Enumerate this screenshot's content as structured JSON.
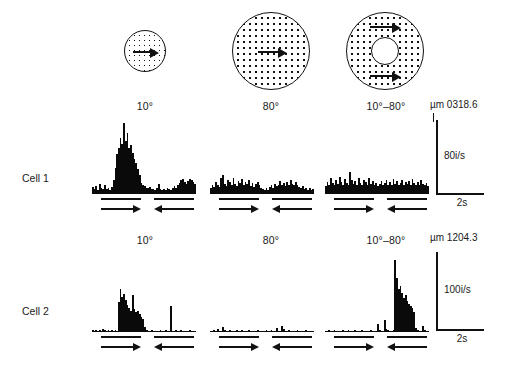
{
  "figure": {
    "type": "neurophysiology-psth-grid",
    "columns": [
      {
        "id": "c10",
        "label": "10°",
        "stimulus": "small-dotted-disc"
      },
      {
        "id": "c80",
        "label": "80°",
        "stimulus": "large-dotted-disc"
      },
      {
        "id": "c1080",
        "label": "10°–80°",
        "stimulus": "dotted-annulus"
      }
    ],
    "rows": [
      {
        "id": "cell1",
        "label": "Cell 1",
        "depth": "µm 0318.6",
        "rate_scale": "80i/s",
        "time_scale": "2s"
      },
      {
        "id": "cell2",
        "label": "Cell 2",
        "depth": "µm 1204.3",
        "rate_scale": "100i/s",
        "time_scale": "2s"
      }
    ],
    "epochs": [
      {
        "index": 0,
        "direction": "right",
        "glyph": "→"
      },
      {
        "index": 1,
        "direction": "left",
        "glyph": "←"
      }
    ]
  },
  "chart_data": {
    "type": "bar",
    "title": "",
    "xlabel": "",
    "ylabel": "impulses per second",
    "grid": false,
    "legend": "none",
    "panels": [
      {
        "row": "Cell 1",
        "column": "10°",
        "ylim": [
          0,
          160
        ],
        "xlim_seconds": [
          0,
          8
        ],
        "values": [
          14,
          10,
          16,
          9,
          22,
          13,
          11,
          18,
          10,
          12,
          9,
          14,
          30,
          55,
          84,
          96,
          118,
          105,
          150,
          112,
          128,
          96,
          104,
          86,
          74,
          66,
          52,
          40,
          24,
          18,
          16,
          13,
          12,
          14,
          11,
          10,
          9,
          12,
          22,
          10,
          8,
          11,
          9,
          13,
          10,
          9,
          12,
          16,
          13,
          19,
          24,
          29,
          31,
          26,
          22,
          28,
          32,
          30,
          26,
          22
        ]
      },
      {
        "row": "Cell 1",
        "column": "80°",
        "ylim": [
          0,
          160
        ],
        "xlim_seconds": [
          0,
          8
        ],
        "values": [
          12,
          20,
          15,
          26,
          18,
          14,
          33,
          40,
          22,
          17,
          30,
          25,
          19,
          34,
          21,
          16,
          28,
          23,
          31,
          18,
          26,
          21,
          30,
          17,
          24,
          14,
          22,
          26,
          18,
          12,
          10,
          8,
          12,
          9,
          14,
          18,
          12,
          22,
          16,
          20,
          28,
          18,
          24,
          16,
          26,
          20,
          30,
          22,
          18,
          26,
          20,
          14,
          12,
          16,
          10,
          13,
          9,
          12,
          8,
          10
        ]
      },
      {
        "row": "Cell 1",
        "column": "10°–80°",
        "ylim": [
          0,
          160
        ],
        "xlim_seconds": [
          0,
          8
        ],
        "values": [
          16,
          26,
          20,
          34,
          24,
          18,
          30,
          22,
          36,
          26,
          20,
          32,
          24,
          18,
          46,
          30,
          22,
          28,
          20,
          34,
          24,
          18,
          30,
          26,
          20,
          34,
          22,
          28,
          18,
          24,
          16,
          22,
          28,
          18,
          24,
          30,
          20,
          26,
          18,
          32,
          22,
          28,
          20,
          24,
          30,
          18,
          26,
          22,
          28,
          20,
          32,
          24,
          18,
          26,
          20,
          30,
          22,
          18,
          24,
          16
        ]
      },
      {
        "row": "Cell 2",
        "column": "10°",
        "ylim": [
          0,
          170
        ],
        "xlim_seconds": [
          0,
          8
        ],
        "values": [
          4,
          3,
          5,
          2,
          4,
          3,
          6,
          4,
          3,
          5,
          2,
          4,
          3,
          5,
          2,
          68,
          96,
          78,
          86,
          72,
          60,
          54,
          46,
          82,
          52,
          44,
          48,
          40,
          34,
          30,
          12,
          4,
          3,
          2,
          4,
          3,
          2,
          3,
          2,
          4,
          3,
          2,
          4,
          3,
          2,
          58,
          3,
          2,
          4,
          3,
          2,
          4,
          3,
          2,
          3,
          2,
          4,
          3,
          2,
          3
        ]
      },
      {
        "row": "Cell 2",
        "column": "80°",
        "ylim": [
          0,
          170
        ],
        "xlim_seconds": [
          0,
          8
        ],
        "values": [
          3,
          2,
          4,
          3,
          6,
          2,
          3,
          12,
          4,
          3,
          2,
          4,
          3,
          2,
          3,
          4,
          2,
          3,
          4,
          2,
          3,
          2,
          4,
          3,
          2,
          3,
          2,
          4,
          3,
          2,
          3,
          2,
          4,
          3,
          2,
          4,
          3,
          2,
          10,
          3,
          2,
          14,
          6,
          3,
          2,
          4,
          3,
          2,
          3,
          2,
          4,
          3,
          2,
          3,
          2,
          4,
          3,
          2,
          3,
          2
        ]
      },
      {
        "row": "Cell 2",
        "column": "10°–80°",
        "ylim": [
          0,
          170
        ],
        "xlim_seconds": [
          0,
          8
        ],
        "values": [
          3,
          2,
          4,
          3,
          2,
          4,
          3,
          2,
          3,
          2,
          4,
          3,
          2,
          4,
          3,
          2,
          3,
          4,
          2,
          3,
          2,
          4,
          3,
          2,
          3,
          2,
          4,
          3,
          2,
          3,
          18,
          4,
          3,
          2,
          26,
          6,
          4,
          3,
          2,
          4,
          160,
          120,
          96,
          104,
          88,
          76,
          82,
          70,
          62,
          58,
          54,
          44,
          8,
          4,
          3,
          2,
          14,
          4,
          3,
          2
        ]
      }
    ]
  }
}
